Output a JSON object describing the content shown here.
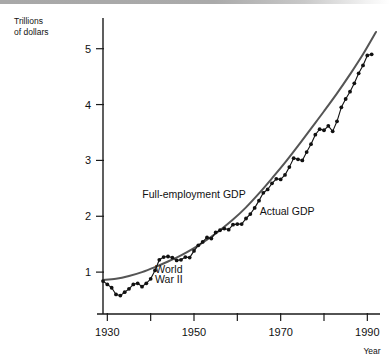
{
  "figure": {
    "background_color": "#ffffff",
    "top_bar_color": "#a8a8a8"
  },
  "chart_data": {
    "type": "line",
    "title": "",
    "xlabel": "Year",
    "ylabel": "Trillions of dollars",
    "ylabel_line1": "Trillions",
    "ylabel_line2": "of dollars",
    "xlim": [
      1929,
      1992
    ],
    "ylim": [
      0.25,
      5.55
    ],
    "grid": false,
    "legend_position": "inline-annotations",
    "x_ticks_major": [
      1930,
      1950,
      1970,
      1990
    ],
    "x_ticks_minor": [
      1940,
      1960,
      1980
    ],
    "x_tick_labels": [
      "1930",
      "1950",
      "1970",
      "1990"
    ],
    "y_ticks": [
      1,
      2,
      3,
      4,
      5
    ],
    "y_tick_labels": [
      "1",
      "2",
      "3",
      "4",
      "5"
    ],
    "annotations": [
      {
        "text": "Full-employment GDP",
        "x": 1950.0,
        "y": 2.33,
        "anchor": "middle"
      },
      {
        "text": "Actual GDP",
        "x": 1971.5,
        "y": 2.02,
        "anchor": "middle"
      },
      {
        "text": "World",
        "x": 1944.2,
        "y": 0.98,
        "anchor": "middle"
      },
      {
        "text": "War II",
        "x": 1944.2,
        "y": 0.8,
        "anchor": "middle"
      }
    ],
    "series": [
      {
        "name": "Full-employment GDP",
        "style": "smooth-line",
        "color": "#555555",
        "x": [
          1929,
          1932,
          1935,
          1938,
          1941,
          1944,
          1947,
          1950,
          1953,
          1956,
          1959,
          1962,
          1965,
          1968,
          1971,
          1974,
          1977,
          1980,
          1983,
          1986,
          1989,
          1992
        ],
        "values": [
          0.86,
          0.88,
          0.93,
          1.0,
          1.09,
          1.19,
          1.3,
          1.43,
          1.58,
          1.75,
          1.94,
          2.16,
          2.41,
          2.68,
          2.96,
          3.26,
          3.57,
          3.88,
          4.2,
          4.54,
          4.9,
          5.3
        ]
      },
      {
        "name": "Actual GDP",
        "style": "line-markers",
        "color": "#111111",
        "x": [
          1929,
          1930,
          1931,
          1932,
          1933,
          1934,
          1935,
          1936,
          1937,
          1938,
          1939,
          1940,
          1941,
          1942,
          1943,
          1944,
          1945,
          1946,
          1947,
          1948,
          1949,
          1950,
          1951,
          1952,
          1953,
          1954,
          1955,
          1956,
          1957,
          1958,
          1959,
          1960,
          1961,
          1962,
          1963,
          1964,
          1965,
          1966,
          1967,
          1968,
          1969,
          1970,
          1971,
          1972,
          1973,
          1974,
          1975,
          1976,
          1977,
          1978,
          1979,
          1980,
          1981,
          1982,
          1983,
          1984,
          1985,
          1986,
          1987,
          1988,
          1989,
          1990,
          1991
        ],
        "values": [
          0.86,
          0.79,
          0.74,
          0.64,
          0.63,
          0.69,
          0.75,
          0.85,
          0.89,
          0.86,
          0.93,
          1.0,
          1.18,
          1.4,
          1.64,
          1.77,
          1.75,
          1.55,
          1.53,
          1.59,
          1.58,
          1.72,
          1.85,
          1.92,
          2.01,
          2.0,
          2.14,
          2.18,
          2.22,
          2.2,
          2.35,
          2.41,
          2.47,
          2.62,
          2.73,
          2.89,
          3.08,
          3.28,
          3.36,
          3.52,
          3.63,
          3.64,
          3.76,
          3.96,
          4.19,
          4.17,
          4.16,
          4.38,
          4.58,
          4.84,
          5.0,
          4.99,
          5.11,
          5.0,
          5.23,
          5.6,
          5.82,
          6.01,
          6.22,
          6.47,
          6.69,
          6.79,
          6.76
        ]
      }
    ],
    "actual_gdp_plotted": {
      "note": "values as rendered on the chart axis (trillions)",
      "x": [
        1929,
        1930,
        1931,
        1932,
        1933,
        1934,
        1935,
        1936,
        1937,
        1938,
        1939,
        1940,
        1941,
        1942,
        1943,
        1944,
        1945,
        1946,
        1947,
        1948,
        1949,
        1950,
        1951,
        1952,
        1953,
        1954,
        1955,
        1956,
        1957,
        1958,
        1959,
        1960,
        1961,
        1962,
        1963,
        1964,
        1965,
        1966,
        1967,
        1968,
        1969,
        1970,
        1971,
        1972,
        1973,
        1974,
        1975,
        1976,
        1977,
        1978,
        1979,
        1980,
        1981,
        1982,
        1983,
        1984,
        1985,
        1986,
        1987,
        1988,
        1989,
        1990,
        1991
      ],
      "y": [
        0.84,
        0.78,
        0.72,
        0.6,
        0.58,
        0.64,
        0.7,
        0.78,
        0.8,
        0.74,
        0.8,
        0.88,
        1.03,
        1.22,
        1.27,
        1.28,
        1.26,
        1.21,
        1.22,
        1.27,
        1.26,
        1.38,
        1.48,
        1.54,
        1.62,
        1.6,
        1.71,
        1.75,
        1.78,
        1.76,
        1.85,
        1.86,
        1.86,
        1.96,
        2.04,
        2.15,
        2.28,
        2.42,
        2.48,
        2.59,
        2.67,
        2.66,
        2.74,
        2.88,
        3.04,
        3.02,
        3.0,
        3.15,
        3.29,
        3.46,
        3.56,
        3.54,
        3.62,
        3.52,
        3.7,
        3.95,
        4.1,
        4.23,
        4.38,
        4.56,
        4.7,
        4.88,
        4.9,
        5.15
      ]
    }
  }
}
